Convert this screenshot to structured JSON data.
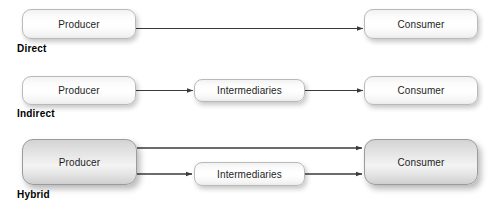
{
  "diagram": {
    "rows": [
      {
        "key": "direct",
        "label": "Direct",
        "nodes": [
          {
            "key": "producer",
            "label": "Producer"
          },
          {
            "key": "consumer",
            "label": "Consumer"
          }
        ]
      },
      {
        "key": "indirect",
        "label": "Indirect",
        "nodes": [
          {
            "key": "producer",
            "label": "Producer"
          },
          {
            "key": "intermediaries",
            "label": "Intermediaries"
          },
          {
            "key": "consumer",
            "label": "Consumer"
          }
        ]
      },
      {
        "key": "hybrid",
        "label": "Hybrid",
        "nodes": [
          {
            "key": "producer",
            "label": "Producer"
          },
          {
            "key": "intermediaries",
            "label": "Intermediaries"
          },
          {
            "key": "consumer",
            "label": "Consumer"
          }
        ]
      }
    ],
    "colors": {
      "arrow": "#3a3a3a",
      "box_border": "#b9b9b9",
      "box_border_gray": "#9b9b9b",
      "text": "#1d1d1d",
      "label_text": "#000000",
      "background": "#ffffff"
    }
  }
}
